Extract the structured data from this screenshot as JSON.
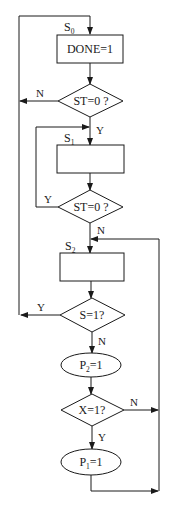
{
  "diagram": {
    "type": "flowchart",
    "colors": {
      "stroke": "#1a1a1a",
      "background": "#ffffff"
    },
    "states": {
      "s0": {
        "label": "S",
        "sub": "0"
      },
      "s1": {
        "label": "S",
        "sub": "1"
      },
      "s2": {
        "label": "S",
        "sub": "2"
      }
    },
    "nodes": {
      "done_box": {
        "text": "DONE=1"
      },
      "st_check_1": {
        "text": "ST=0 ?"
      },
      "s1_box": {
        "text": ""
      },
      "st_check_2": {
        "text": "ST=0 ?"
      },
      "s2_box": {
        "text": ""
      },
      "s_check": {
        "text": "S=1?"
      },
      "p2_oval": {
        "prefix": "P",
        "sub": "2",
        "suffix": "=1"
      },
      "x_check": {
        "text": "X=1?"
      },
      "p1_oval": {
        "prefix": "P",
        "sub": "1",
        "suffix": "=1"
      }
    },
    "edge_labels": {
      "st1_no": "N",
      "st1_yes": "Y",
      "st2_yes": "Y",
      "st2_no": "N",
      "s_yes": "Y",
      "s_no": "N",
      "x_no": "N",
      "x_yes": "Y"
    }
  }
}
